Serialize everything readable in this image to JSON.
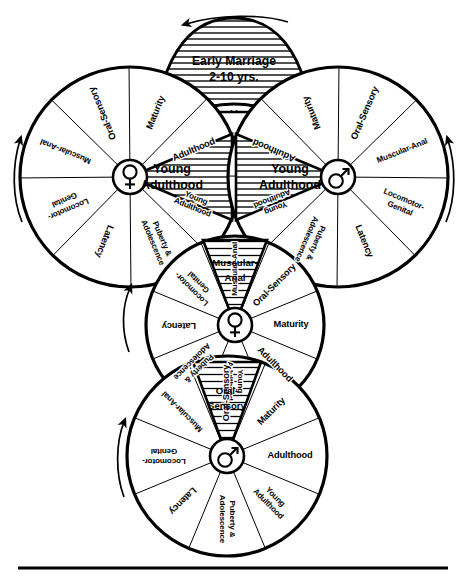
{
  "figure": {
    "bottom_rule": "horizontal-rule",
    "background_color": "#ffffff",
    "line_color": "#000000"
  },
  "stages": {
    "oral_sensory": "Oral-Sensory",
    "muscular_anal": "Muscular-Anal",
    "muscular_anal_l1": "Muscular-",
    "muscular_anal_l2": "Anal",
    "oral_sensory_l1": "Oral-",
    "oral_sensory_l2": "Sensory",
    "locomotor_genital_l1": "Locomotor-",
    "locomotor_genital_l2": "Genital",
    "latency": "Latency",
    "puberty_l1": "Puberty &",
    "puberty_l2": "Adolescence",
    "young_adulthood_l1": "Young",
    "young_adulthood_l2": "Adulthood",
    "adulthood": "Adulthood",
    "maturity": "Maturity"
  },
  "connector": {
    "marriage_line1": "Early Marriage",
    "marriage_line2": "2-10 yrs."
  },
  "wheels": [
    {
      "id": "left-wheel",
      "name": "left-female-wheel",
      "hub_symbol": "venus-symbol",
      "hub_glyph": "♀",
      "cx": 130,
      "cy": 177,
      "r": 110,
      "rotation_arrow": "counterclockwise-arrow",
      "sectors": [
        {
          "label": "Maturity",
          "mid_deg": -68
        },
        {
          "label": "Oral-Sensory",
          "mid_deg": -113
        },
        {
          "label": "Muscular-Anal",
          "mid_deg": -158
        },
        {
          "label": "Locomotor-Genital",
          "mid_deg": 157
        },
        {
          "label": "Latency",
          "mid_deg": 112
        },
        {
          "label": "Puberty & Adolescence",
          "mid_deg": 67
        },
        {
          "label": "Young Adulthood",
          "mid_deg": 22
        },
        {
          "label": "Adulthood",
          "mid_deg": -23
        }
      ]
    },
    {
      "id": "right-wheel",
      "name": "right-male-wheel",
      "hub_symbol": "mars-symbol",
      "hub_glyph": "♂",
      "cx": 338,
      "cy": 177,
      "r": 110,
      "rotation_arrow": "clockwise-arrow",
      "sectors": [
        {
          "label": "Maturity",
          "mid_deg": -112
        },
        {
          "label": "Oral-Sensory",
          "mid_deg": -67
        },
        {
          "label": "Muscular-Anal",
          "mid_deg": -22
        },
        {
          "label": "Locomotor-Genital",
          "mid_deg": 23
        },
        {
          "label": "Latency",
          "mid_deg": 68
        },
        {
          "label": "Puberty & Adolescence",
          "mid_deg": 113
        },
        {
          "label": "Young Adulthood",
          "mid_deg": 158
        },
        {
          "label": "Adulthood",
          "mid_deg": -157
        }
      ]
    },
    {
      "id": "middle-wheel",
      "name": "middle-female-child-wheel",
      "hub_symbol": "venus-symbol",
      "hub_glyph": "♀",
      "cx": 235,
      "cy": 325,
      "r": 89,
      "rotation_arrow": "counterclockwise-arrow",
      "sectors": [
        {
          "label": "Muscular-Anal",
          "mid_deg": -90
        },
        {
          "label": "Oral-Sensory",
          "mid_deg": -45
        },
        {
          "label": "Maturity",
          "mid_deg": 0
        },
        {
          "label": "Adulthood",
          "mid_deg": 45
        },
        {
          "label": "Young Adulthood",
          "mid_deg": 90
        },
        {
          "label": "Puberty & Adolescence",
          "mid_deg": 135
        },
        {
          "label": "Latency",
          "mid_deg": 180
        },
        {
          "label": "Locomotor-Genital",
          "mid_deg": -135
        }
      ]
    },
    {
      "id": "bottom-wheel",
      "name": "bottom-male-child-wheel",
      "hub_symbol": "mars-symbol",
      "hub_glyph": "♂",
      "cx": 227,
      "cy": 456,
      "r": 100,
      "rotation_arrow": "counterclockwise-arrow",
      "sectors": [
        {
          "label": "Oral-Sensory",
          "mid_deg": -90
        },
        {
          "label": "Maturity",
          "mid_deg": -45
        },
        {
          "label": "Adulthood",
          "mid_deg": 0
        },
        {
          "label": "Young Adulthood",
          "mid_deg": 45
        },
        {
          "label": "Puberty & Adolescence",
          "mid_deg": 90
        },
        {
          "label": "Latency",
          "mid_deg": 135
        },
        {
          "label": "Locomotor-Genital",
          "mid_deg": 180
        },
        {
          "label": "Muscular-Anal",
          "mid_deg": -135
        }
      ]
    }
  ]
}
